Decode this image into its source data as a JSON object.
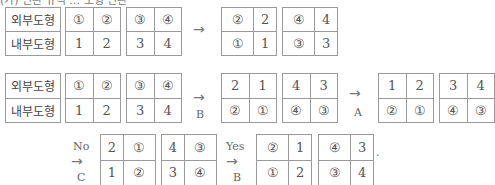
{
  "header_fragment": "(가) 변환 규칙 … 도형 변환",
  "labels": {
    "outer": "외부도형",
    "inner": "내부도형"
  },
  "row1": {
    "input": {
      "a": [
        "①",
        "②"
      ],
      "b": [
        "1",
        "2"
      ],
      "c": [
        "③",
        "④"
      ],
      "d": [
        "3",
        "4"
      ]
    },
    "arrow": "→",
    "op": "",
    "output": [
      {
        "top": [
          "②",
          "2"
        ],
        "bottom": [
          "①",
          "1"
        ]
      },
      {
        "top": [
          "④",
          "4"
        ],
        "bottom": [
          "③",
          "3"
        ]
      }
    ]
  },
  "row2": {
    "input": {
      "a": [
        "①",
        "②"
      ],
      "b": [
        "1",
        "2"
      ],
      "c": [
        "③",
        "④"
      ],
      "d": [
        "3",
        "4"
      ]
    },
    "step1": {
      "arrow": "→",
      "op": "B",
      "output": [
        {
          "top": [
            "2",
            "1"
          ],
          "bottom": [
            "②",
            "①"
          ]
        },
        {
          "top": [
            "4",
            "3"
          ],
          "bottom": [
            "④",
            "③"
          ]
        }
      ]
    },
    "step2": {
      "arrow": "→",
      "op": "A",
      "output": [
        {
          "top": [
            "1",
            "2"
          ],
          "bottom": [
            "②",
            "①"
          ]
        },
        {
          "top": [
            "3",
            "4"
          ],
          "bottom": [
            "④",
            "③"
          ]
        }
      ]
    }
  },
  "row3": {
    "step1": {
      "cond": "No",
      "arrow": "→",
      "op": "C",
      "output": [
        {
          "top": [
            "2",
            "①"
          ],
          "bottom": [
            "1",
            "②"
          ]
        },
        {
          "top": [
            "4",
            "③"
          ],
          "bottom": [
            "3",
            "④"
          ]
        }
      ]
    },
    "step2": {
      "cond": "Yes",
      "arrow": "→",
      "op": "B",
      "output": [
        {
          "top": [
            "②",
            "1"
          ],
          "bottom": [
            "①",
            "2"
          ]
        },
        {
          "top": [
            "④",
            "3"
          ],
          "bottom": [
            "③",
            "4"
          ]
        }
      ]
    },
    "trail": "."
  }
}
